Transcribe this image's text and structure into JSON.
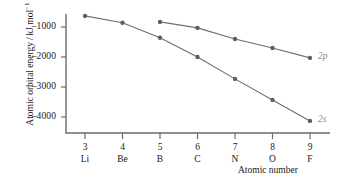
{
  "chart_data": {
    "type": "line",
    "title": "",
    "xlabel": "Atomic number",
    "ylabel": "Atomic orbital energy / kJ mol−1",
    "ylabel_main": "Atomic orbital energy / kJ mol",
    "ylabel_exp": "−1",
    "x": [
      3,
      4,
      5,
      6,
      7,
      8,
      9
    ],
    "categories": [
      "3",
      "4",
      "5",
      "6",
      "7",
      "8",
      "9"
    ],
    "element_symbols": [
      "Li",
      "Be",
      "B",
      "C",
      "N",
      "O",
      "F"
    ],
    "xtick_labels": [
      "3",
      "4",
      "5",
      "6",
      "7",
      "8",
      "9"
    ],
    "ytick_labels": [
      "–1000",
      "–2000",
      "–3000",
      "–4000"
    ],
    "ytick_values": [
      -1000,
      -2000,
      -3000,
      -4000
    ],
    "ylim": [
      -4400,
      -300
    ],
    "xlim": [
      2.6,
      9.6
    ],
    "grid": false,
    "legend_position": "right-inline",
    "series": [
      {
        "name": "2s",
        "label": "2s",
        "x": [
          3,
          4,
          5,
          6,
          7,
          8,
          9
        ],
        "values": [
          -630,
          -860,
          -1360,
          -2000,
          -2730,
          -3430,
          -4130
        ],
        "color": "#6e6e6e",
        "label_x": 9,
        "label_y": -4130
      },
      {
        "name": "2p",
        "label": "2p",
        "x": [
          5,
          6,
          7,
          8,
          9
        ],
        "values": [
          -830,
          -1030,
          -1400,
          -1700,
          -2030
        ],
        "color": "#6e6e6e",
        "label_x": 9,
        "label_y": -2030
      }
    ],
    "marker": "circle",
    "axis_color": "#6b6b6b"
  }
}
